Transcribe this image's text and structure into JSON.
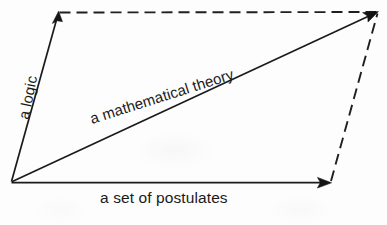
{
  "figure": {
    "background_color": "#fdfdfd",
    "ink_color": "#1a1a1a",
    "width": 387,
    "height": 225
  },
  "labels": {
    "logic": "a logic",
    "theory": "a mathematical theory",
    "postulates": "a set of postulates"
  },
  "geometry": {
    "origin": {
      "x": 11,
      "y": 182
    },
    "top_left": {
      "x": 58,
      "y": 12
    },
    "top_right": {
      "x": 378,
      "y": 12
    },
    "bottom_right": {
      "x": 331,
      "y": 183
    }
  },
  "edges": [
    {
      "name": "logic-vector",
      "style": "solid",
      "arrow": "end",
      "label": "a logic",
      "from": "origin",
      "to": "top_left"
    },
    {
      "name": "postulates-vector",
      "style": "solid",
      "arrow": "end",
      "label": "a set of postulates",
      "from": "origin",
      "to": "bottom_right"
    },
    {
      "name": "theory-resultant",
      "style": "solid",
      "arrow": "end",
      "label": "a mathematical theory",
      "from": "origin",
      "to": "top_right"
    },
    {
      "name": "top-closure",
      "style": "dashed",
      "arrow": "none",
      "label": "",
      "from": "top_left",
      "to": "top_right"
    },
    {
      "name": "right-closure",
      "style": "dashed",
      "arrow": "none",
      "label": "",
      "from": "bottom_right",
      "to": "top_right"
    }
  ]
}
